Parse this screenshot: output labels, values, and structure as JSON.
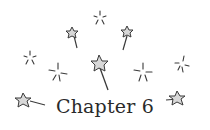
{
  "heading": {
    "title": "Chapter 6"
  },
  "decoration": {
    "icon": "sparkle-wand-stars-icon",
    "stroke_color": "#3a3a3a",
    "fill_color": "#d8d8d8"
  }
}
